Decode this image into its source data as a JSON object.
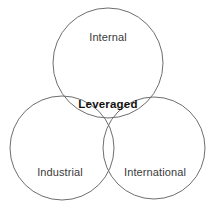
{
  "diagram": {
    "type": "venn",
    "set_count": 3,
    "background_color": "#ffffff",
    "stroke_color": "#6e6e6e",
    "label_color": "#3a3a3a",
    "intersection_label_color": "#111111",
    "circles": [
      {
        "id": "internal",
        "label": "Internal",
        "cx": 108,
        "cy": 63,
        "r": 55
      },
      {
        "id": "industrial",
        "label": "Industrial",
        "cx": 62,
        "cy": 148,
        "r": 52
      },
      {
        "id": "international",
        "label": "International",
        "cx": 154,
        "cy": 148,
        "r": 51
      }
    ],
    "labels": {
      "top": "Internal",
      "bottom_left": "Industrial",
      "bottom_right": "International",
      "center": "Leveraged"
    }
  }
}
